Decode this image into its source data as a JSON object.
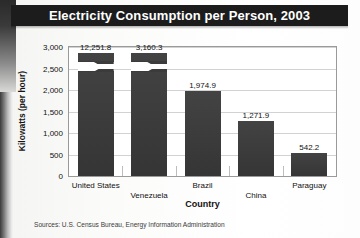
{
  "figure": {
    "title": "Electricity Consumption per Person, 2003",
    "source": "Sources: U.S. Census Bureau, Energy Information Administration"
  },
  "colors": {
    "title_band": "#1c1c1c",
    "title_text": "#ffffff",
    "bar_fill": "#3b3b3b",
    "plot_background": "#ffffff",
    "gridline": "#d2d2d2",
    "axis_border": "#9a9a9a",
    "text": "#111111"
  },
  "chart_data": {
    "type": "bar",
    "title": "Electricity Consumption per Person, 2003",
    "xlabel": "Country",
    "ylabel": "Kilowatts (per hour)",
    "categories": [
      "United States",
      "Venezuela",
      "Brazil",
      "China",
      "Paraguay"
    ],
    "values": [
      12251.8,
      3160.3,
      1974.9,
      1271.9,
      542.2
    ],
    "value_labels": [
      "12,251.8",
      "3,160.3",
      "1,974.9",
      "1,271.9",
      "542.2"
    ],
    "ylim": [
      0,
      3000
    ],
    "yticks": [
      0,
      500,
      1000,
      1500,
      2000,
      2500,
      3000
    ],
    "ytick_labels": [
      "0",
      "500",
      "1,000",
      "1,500",
      "2,000",
      "2,500",
      "3,000"
    ],
    "grid": true,
    "legend": "none",
    "axis_break": {
      "series_index": 0,
      "category": "United States",
      "note": "bar truncated with break mark; actual value exceeds axis maximum"
    },
    "label_rows": [
      0,
      1,
      0,
      1,
      0
    ]
  }
}
